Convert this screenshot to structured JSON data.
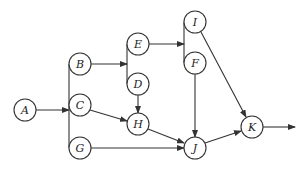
{
  "diagram": {
    "type": "activity-network",
    "nodes": [
      {
        "id": "A",
        "label": "A",
        "x": 25,
        "y": 110
      },
      {
        "id": "B",
        "label": "B",
        "x": 80,
        "y": 64
      },
      {
        "id": "C",
        "label": "C",
        "x": 80,
        "y": 105
      },
      {
        "id": "G",
        "label": "G",
        "x": 80,
        "y": 148
      },
      {
        "id": "E",
        "label": "E",
        "x": 138,
        "y": 44
      },
      {
        "id": "D",
        "label": "D",
        "x": 138,
        "y": 84
      },
      {
        "id": "H",
        "label": "H",
        "x": 138,
        "y": 124
      },
      {
        "id": "I",
        "label": "I",
        "x": 195,
        "y": 22
      },
      {
        "id": "F",
        "label": "F",
        "x": 195,
        "y": 63
      },
      {
        "id": "J",
        "label": "J",
        "x": 195,
        "y": 148
      },
      {
        "id": "K",
        "label": "K",
        "x": 252,
        "y": 127
      }
    ],
    "edges": [
      {
        "from": "A",
        "to": "B|C|G",
        "note": "A fans out via vertical bar to B, C, G"
      },
      {
        "from": "B",
        "to": "E|D",
        "note": "B fans out via vertical bar to E, D"
      },
      {
        "from": "E",
        "to": "I|F",
        "note": "E fans out via vertical bar to I, F"
      },
      {
        "from": "C",
        "to": "H"
      },
      {
        "from": "D",
        "to": "H"
      },
      {
        "from": "H",
        "to": "J"
      },
      {
        "from": "G",
        "to": "J"
      },
      {
        "from": "F",
        "to": "J"
      },
      {
        "from": "I",
        "to": "K"
      },
      {
        "from": "J",
        "to": "K"
      },
      {
        "from": "K",
        "to": "end",
        "note": "outgoing arrow to the right"
      }
    ],
    "colors": {
      "stroke": "#333333",
      "fill": "#ffffff",
      "text": "#222222"
    }
  }
}
